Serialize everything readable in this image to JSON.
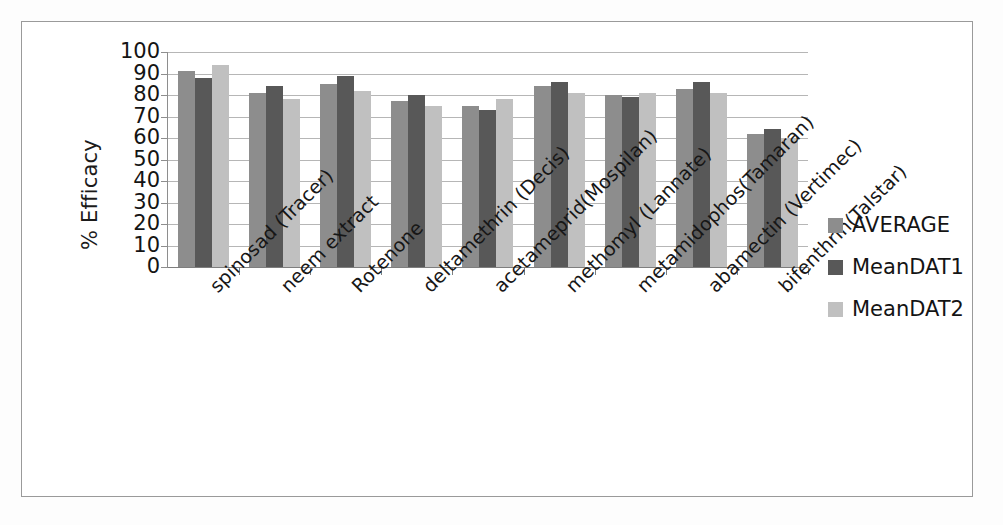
{
  "chart_data": {
    "type": "bar",
    "title": "",
    "xlabel": "",
    "ylabel": "% Efficacy",
    "ylim": [
      0,
      100
    ],
    "ytick_step": 10,
    "yticks": [
      "100",
      "90",
      "80",
      "70",
      "60",
      "50",
      "40",
      "30",
      "20",
      "10",
      "0"
    ],
    "grid": true,
    "legend_position": "right",
    "categories": [
      "spinosad (Tracer)",
      "neem extract",
      "Rotenone",
      "deltamethrin (Decis)",
      "acetameprid(Mospilan)",
      "methomyl (Lannate)",
      "metamidophos(Tamaran)",
      "abamectin (Vertimec)",
      "bifenthrin(Talstar)"
    ],
    "series": [
      {
        "name": "AVERAGE",
        "color": "#8d8d8d",
        "values": [
          91,
          81,
          85,
          77,
          75,
          84,
          80,
          83,
          62
        ]
      },
      {
        "name": "MeanDAT1",
        "color": "#585858",
        "values": [
          88,
          84,
          89,
          80,
          73,
          86,
          79,
          86,
          64
        ]
      },
      {
        "name": "MeanDAT2",
        "color": "#c0c0c0",
        "values": [
          94,
          78,
          82,
          75,
          78,
          81,
          81,
          81,
          60
        ]
      }
    ]
  },
  "legend": {
    "items": [
      {
        "label": "AVERAGE",
        "color": "#8d8d8d"
      },
      {
        "label": "MeanDAT1",
        "color": "#585858"
      },
      {
        "label": "MeanDAT2",
        "color": "#c0c0c0"
      }
    ]
  }
}
